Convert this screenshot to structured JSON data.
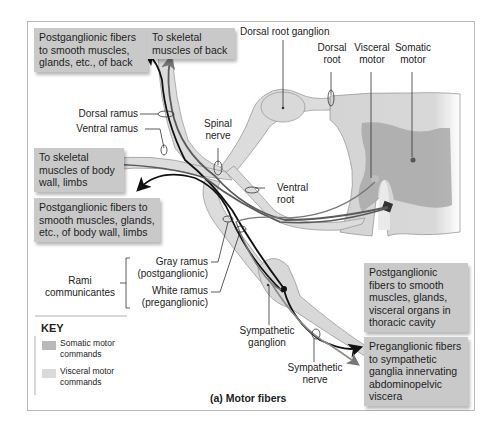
{
  "figure": {
    "caption": "(a) Motor fibers",
    "colors": {
      "somatic": "#5a5a5a",
      "visceral_pre": "#111111",
      "visceral_post_arrow": "#8a8a8a",
      "nerve_fill": "#dcdcdc",
      "grey_matter": "#a9a9a9",
      "cord_fill": "#d6d6d6",
      "box_fill": "#c9c9c9"
    }
  },
  "boxes": {
    "postgang_back": "Postganglionic fibers to smooth muscles, glands, etc., of back",
    "skeletal_back": "To skeletal muscles of back",
    "skeletal_body": "To skeletal muscles of body wall, limbs",
    "postgang_body": "Postganglionic fibers to smooth muscles, glands, etc., of body wall, limbs",
    "postgang_thoracic": "Postganglionic fibers to smooth muscles, glands, visceral organs in thoracic cavity",
    "pregang_abdominal": "Preganglionic fibers to sympathetic ganglia innervating abdominopelvic viscera"
  },
  "labels": {
    "dorsal_root_ganglion": "Dorsal root ganglion",
    "dorsal_root": "Dorsal root",
    "visceral_motor": "Visceral motor",
    "somatic_motor": "Somatic motor",
    "dorsal_ramus": "Dorsal ramus",
    "ventral_ramus": "Ventral ramus",
    "spinal_nerve": "Spinal nerve",
    "ventral_root": "Ventral root",
    "gray_ramus": "Gray ramus",
    "gray_ramus_sub": "(postganglionic)",
    "white_ramus": "White ramus",
    "white_ramus_sub": "(preganglionic)",
    "rami_communicantes": "Rami communicantes",
    "sympathetic_ganglion": "Sympathetic ganglion",
    "sympathetic_nerve": "Sympathetic nerve"
  },
  "key": {
    "title": "KEY",
    "items": [
      {
        "label": "Somatic motor commands",
        "color": "#b9b9b9"
      },
      {
        "label": "Visceral motor commands",
        "color": "#dadada"
      }
    ]
  }
}
